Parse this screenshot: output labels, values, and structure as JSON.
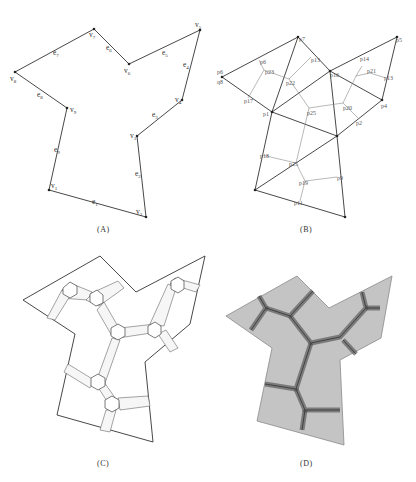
{
  "panels": {
    "a": {
      "caption": "(A)",
      "vertices": [
        {
          "label": "v1",
          "x": 49,
          "y": 190
        },
        {
          "label": "v2",
          "x": 146,
          "y": 217
        },
        {
          "label": "v3",
          "x": 137,
          "y": 136
        },
        {
          "label": "v4",
          "x": 182,
          "y": 100
        },
        {
          "label": "v5",
          "x": 200,
          "y": 30
        },
        {
          "label": "v6",
          "x": 129,
          "y": 64
        },
        {
          "label": "v7",
          "x": 94,
          "y": 29
        },
        {
          "label": "v8",
          "x": 15,
          "y": 72
        },
        {
          "label": "v9",
          "x": 67,
          "y": 108
        }
      ],
      "edges": [
        "e1",
        "e2",
        "e3",
        "e4",
        "e5",
        "e6",
        "e7",
        "e8",
        "e9"
      ]
    },
    "b": {
      "caption": "(B)",
      "point_labels": [
        "p1",
        "p2",
        "p3",
        "p4",
        "p5",
        "p6",
        "p7",
        "p8",
        "p9",
        "p10",
        "p11",
        "p12",
        "p13",
        "p14",
        "p15",
        "p16",
        "p17",
        "p18",
        "p19",
        "p20",
        "p21",
        "p22",
        "p23",
        "p24",
        "p25",
        "p26",
        "p27"
      ]
    },
    "c": {
      "caption": "(C)"
    },
    "d": {
      "caption": "(D)"
    }
  }
}
